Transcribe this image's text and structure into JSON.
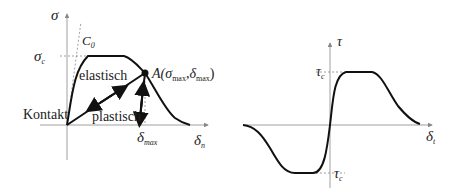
{
  "left_diagram": {
    "axis_y_label": "σ",
    "axis_x_label": "δ",
    "axis_x_sub": "n",
    "sigma_c_label": "σ",
    "sigma_c_sub": "c",
    "c0_label": "C",
    "c0_sub": "0",
    "elastic_label": "elastisch",
    "plastic_label": "plastisch",
    "contact_label": "Kontakt",
    "point_label_prefix": "A(",
    "point_sigma": "σ",
    "point_sigma_sub": "max",
    "point_comma": ",",
    "point_delta": "δ",
    "point_delta_sub": "max",
    "point_suffix": ")",
    "delta_max_label": "δ",
    "delta_max_sub": "max"
  },
  "right_diagram": {
    "axis_y_label": "τ",
    "axis_x_label": "δ",
    "axis_x_sub": "t",
    "tau_c_top_label": "τ",
    "tau_c_top_sub": "c",
    "tau_c_bottom_label": "τ",
    "tau_c_bottom_sub": "c"
  },
  "colors": {
    "curve": "#111111",
    "axis": "#888888",
    "dashed": "#777777"
  }
}
